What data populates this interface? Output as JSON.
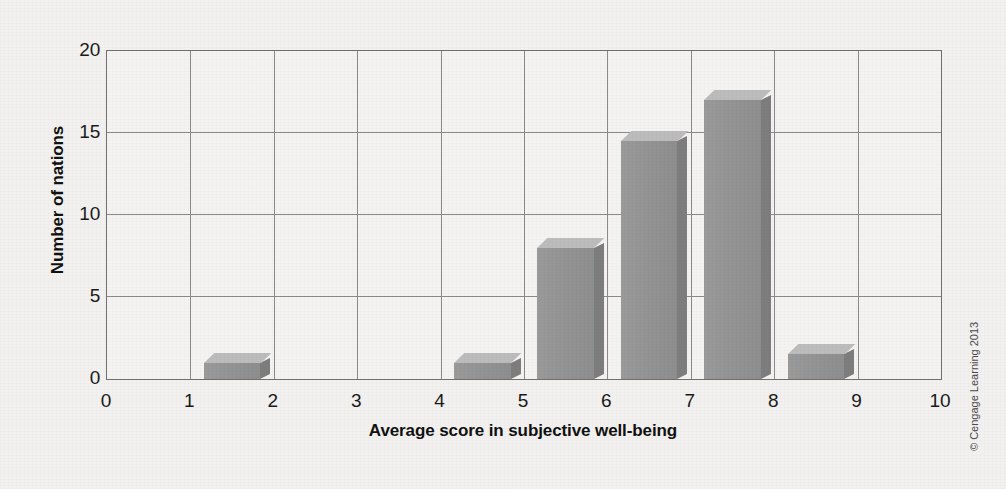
{
  "credit": "© Cengage Learning 2013",
  "chart_data": {
    "type": "bar",
    "title": "",
    "subtitle": "",
    "xlabel": "Average score in subjective well-being",
    "ylabel": "Number of nations",
    "xlim": [
      0,
      10
    ],
    "ylim": [
      0,
      20
    ],
    "xticks": [
      0,
      1,
      2,
      3,
      4,
      5,
      6,
      7,
      8,
      9,
      10
    ],
    "yticks": [
      0,
      5,
      10,
      15,
      20
    ],
    "grid": true,
    "legend": "none",
    "bar_style": "3d-gray",
    "colors": {
      "bar_front": "#949494",
      "bar_side": "#7d7d7d",
      "bar_top": "#bcbcbc",
      "grid": "#8a8a8a",
      "axis": "#6f6f6f",
      "background": "#f2f1ef",
      "text": "#1a1a1a"
    },
    "bins": [
      {
        "label": "0-1",
        "x_start": 0,
        "x_end": 1,
        "value": 0
      },
      {
        "label": "1-2",
        "x_start": 1,
        "x_end": 2,
        "value": 1
      },
      {
        "label": "2-3",
        "x_start": 2,
        "x_end": 3,
        "value": 0
      },
      {
        "label": "3-4",
        "x_start": 3,
        "x_end": 4,
        "value": 0
      },
      {
        "label": "4-5",
        "x_start": 4,
        "x_end": 5,
        "value": 1
      },
      {
        "label": "5-6",
        "x_start": 5,
        "x_end": 6,
        "value": 8
      },
      {
        "label": "6-7",
        "x_start": 6,
        "x_end": 7,
        "value": 14.5
      },
      {
        "label": "7-8",
        "x_start": 7,
        "x_end": 8,
        "value": 17
      },
      {
        "label": "8-9",
        "x_start": 8,
        "x_end": 9,
        "value": 1.5
      },
      {
        "label": "9-10",
        "x_start": 9,
        "x_end": 10,
        "value": 0
      }
    ],
    "categories": [
      "0-1",
      "1-2",
      "2-3",
      "3-4",
      "4-5",
      "5-6",
      "6-7",
      "7-8",
      "8-9",
      "9-10"
    ],
    "values": [
      0,
      1,
      0,
      0,
      1,
      8,
      14.5,
      17,
      1.5,
      0
    ]
  }
}
